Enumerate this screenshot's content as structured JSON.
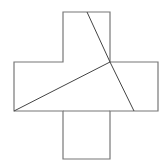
{
  "diagram": {
    "type": "dissection",
    "canvas": {
      "width": 167,
      "height": 168
    },
    "colors": {
      "background": "#ffffff",
      "outline": "#777777",
      "cut_line": "#444444"
    },
    "outline_points": [
      [
        63,
        12
      ],
      [
        110,
        12
      ],
      [
        110,
        62
      ],
      [
        158,
        62
      ],
      [
        158,
        111
      ],
      [
        110,
        111
      ],
      [
        110,
        159
      ],
      [
        63,
        159
      ],
      [
        63,
        111
      ],
      [
        14,
        111
      ],
      [
        14,
        62
      ],
      [
        63,
        62
      ]
    ],
    "cut_lines": [
      {
        "from": [
          87,
          12
        ],
        "to": [
          110,
          62
        ]
      },
      {
        "from": [
          110,
          62
        ],
        "to": [
          134,
          111
        ]
      },
      {
        "from": [
          14,
          111
        ],
        "to": [
          110,
          62
        ]
      }
    ],
    "inner_edge": {
      "from": [
        63,
        111
      ],
      "to": [
        110,
        111
      ]
    }
  }
}
